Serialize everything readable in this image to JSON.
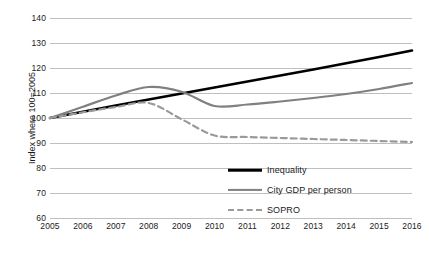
{
  "chart_data": {
    "type": "line",
    "title": "",
    "xlabel": "",
    "ylabel": "Index where 100=2005",
    "x": [
      2005,
      2006,
      2007,
      2008,
      2009,
      2010,
      2011,
      2012,
      2013,
      2014,
      2015,
      2016
    ],
    "categories": [
      "2005",
      "2006",
      "2007",
      "2008",
      "2009",
      "2010",
      "2011",
      "2012",
      "2013",
      "2014",
      "2015",
      "2016"
    ],
    "xlim": [
      2005,
      2016
    ],
    "ylim": [
      60,
      140
    ],
    "yticks": [
      60,
      70,
      80,
      90,
      100,
      110,
      120,
      130,
      140
    ],
    "ytick_labels": [
      "60",
      "70",
      "80",
      "90",
      "100",
      "110",
      "120",
      "130",
      "140"
    ],
    "grid": true,
    "legend_position": "inside-bottom-right",
    "series": [
      {
        "name": "Inequality",
        "style": "solid",
        "color": "#000000",
        "width": 2.6,
        "values": [
          100,
          102.5,
          105,
          107.4,
          109.8,
          112.2,
          114.6,
          117,
          119.4,
          121.9,
          124.4,
          127
        ]
      },
      {
        "name": "City GDP per person",
        "style": "solid",
        "color": "#808080",
        "width": 2.2,
        "values": [
          100,
          104.5,
          109,
          112.4,
          110.5,
          104.8,
          105.4,
          106.6,
          108,
          109.6,
          111.6,
          114
        ]
      },
      {
        "name": "SOPRO",
        "style": "dashed",
        "color": "#9a9a9a",
        "width": 2.2,
        "values": [
          100,
          102.3,
          104.4,
          106,
          99.5,
          93,
          92.4,
          92,
          91.6,
          91.2,
          90.8,
          90.4
        ]
      }
    ]
  },
  "legend": {
    "items": [
      {
        "label": "Inequality",
        "swatch": "sw-solid-black"
      },
      {
        "label": "City GDP per person",
        "swatch": "sw-solid-gray"
      },
      {
        "label": "SOPRO",
        "swatch": "sw-dashed-gray"
      }
    ]
  },
  "colors": {
    "inequality": "#000000",
    "city_gdp": "#808080",
    "sopro": "#9a9a9a",
    "gridline": "#bfbfbf",
    "background": "#ffffff"
  }
}
